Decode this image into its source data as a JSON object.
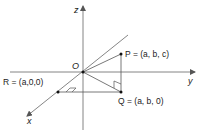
{
  "diagram": {
    "type": "3d-coordinate-axes",
    "axes": {
      "x": {
        "label": "x"
      },
      "y": {
        "label": "y"
      },
      "z": {
        "label": "z"
      }
    },
    "origin": {
      "label": "O"
    },
    "points": {
      "P": {
        "name": "P",
        "coords": "(a, b, c)",
        "label": "P = (a, b, c)"
      },
      "Q": {
        "name": "Q",
        "coords": "(a, b, 0)",
        "label": "Q = (a, b, 0)"
      },
      "R": {
        "name": "R",
        "coords": "(a,0,0)",
        "label": "R = (a,0,0)"
      }
    },
    "segments": [
      "O-P",
      "O-Q",
      "P-Q",
      "R-Q"
    ],
    "right_angles": [
      "at Q between P-Q and O-Q",
      "at R between x-axis and R-Q"
    ],
    "colors": {
      "line": "#555555",
      "text": "#222222",
      "point": "#111111"
    }
  }
}
